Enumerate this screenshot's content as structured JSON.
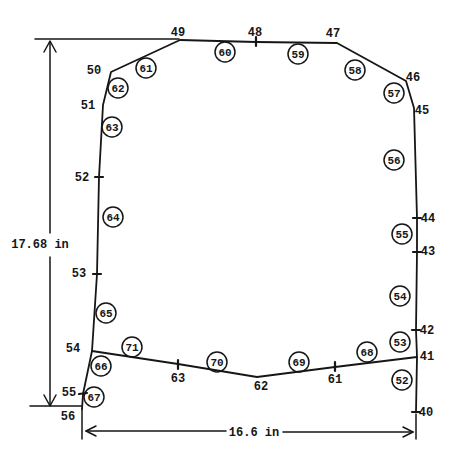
{
  "colors": {
    "ink": "#161616",
    "paper": "#ffffff"
  },
  "dimensions": {
    "vertical_label": "17.68 in",
    "horizontal_label": "16.6 in"
  },
  "node_labels": {
    "n40": "40",
    "n41": "41",
    "n42": "42",
    "n43": "43",
    "n44": "44",
    "n45": "45",
    "n46": "46",
    "n47": "47",
    "n48": "48",
    "n49": "49",
    "n50": "50",
    "n51": "51",
    "n52": "52",
    "n53": "53",
    "n54": "54",
    "n55": "55",
    "n56": "56",
    "n61": "61",
    "n62": "62",
    "n63": "63"
  },
  "element_labels": {
    "e52": "52",
    "e53": "53",
    "e54": "54",
    "e55": "55",
    "e56": "56",
    "e57": "57",
    "e58": "58",
    "e59": "59",
    "e60": "60",
    "e61": "61",
    "e62": "62",
    "e63": "63",
    "e64": "64",
    "e65": "65",
    "e66": "66",
    "e67": "67",
    "e68": "68",
    "e69": "69",
    "e70": "70",
    "e71": "71"
  }
}
